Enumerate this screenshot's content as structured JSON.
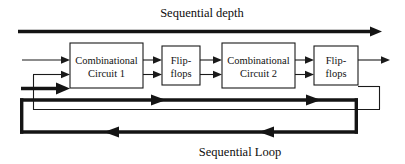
{
  "figure": {
    "title_top": "Sequential depth",
    "title_bottom": "Sequential Loop",
    "background_color": "#ffffff",
    "line_color": "#1a1a1a",
    "thick_line_color": "#141414"
  },
  "blocks": [
    {
      "id": "combinational-circuit-1",
      "line1": "Combinational",
      "line2": "Circuit 1",
      "x": 70,
      "y": 43,
      "width": 73,
      "height": 45
    },
    {
      "id": "flip-flops-1",
      "line1": "Flip-",
      "line2": "flops",
      "x": 162,
      "y": 46,
      "width": 38,
      "height": 39
    },
    {
      "id": "combinational-circuit-2",
      "line1": "Combinational",
      "line2": "Circuit 2",
      "x": 222,
      "y": 43,
      "width": 73,
      "height": 45
    },
    {
      "id": "flip-flops-2",
      "line1": "Flip-",
      "line2": "flops",
      "x": 314,
      "y": 46,
      "width": 44,
      "height": 39
    }
  ],
  "connections": {
    "top_depth_arrow": "left-to-right spanning full width",
    "primary_input_arrow": "external input into Combinational Circuit 1",
    "feedback_thin": "Flip-flops 2 output wraps back to Combinational Circuit 1 second input",
    "feedback_thick": "Sequential Loop wraps back to Combinational Circuit 1"
  }
}
